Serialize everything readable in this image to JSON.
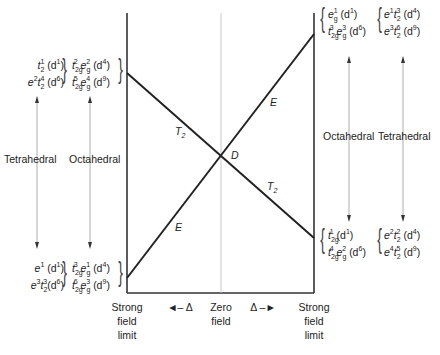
{
  "diagram": {
    "type": "correlation-diagram",
    "line_labels": {
      "t2_upper": "T",
      "t2_upper_sub": "2",
      "t2_lower": "T",
      "t2_lower_sub": "2",
      "e_upper": "E",
      "e_lower": "E",
      "center": "D"
    },
    "left_upper": {
      "tetrahedral": [
        {
          "t": "t",
          "sub": "2",
          "sup": "1",
          "d": "(d",
          "dsup": "1",
          "close": ")"
        },
        {
          "t": "e",
          "sup": "2",
          "t2": "t",
          "sub2": "2",
          "sup2": "4",
          "d": "(d",
          "dsup": "6",
          "close": ")"
        }
      ],
      "octahedral": [
        {
          "a": "t",
          "asub": "2g",
          "asup": "2",
          "b": "e",
          "bsub": "g",
          "bsup": "2",
          "d": "(d",
          "dsup": "4",
          "close": ")"
        },
        {
          "a": "t",
          "asub": "2g",
          "asup": "5",
          "b": "e",
          "bsub": "g",
          "bsup": "4",
          "d": "(d",
          "dsup": "9",
          "close": ")"
        }
      ]
    },
    "left_lower": {
      "tetrahedral": [
        {
          "text": "e",
          "sup": "1",
          "d": "(d",
          "dsup": "1",
          "close": ")"
        },
        {
          "text": "e",
          "sup": "3",
          "t2": "t",
          "sub2": "2",
          "sup2": "3",
          "d": "(d",
          "dsup": "6",
          "close": ")"
        }
      ],
      "octahedral": [
        {
          "a": "t",
          "asub": "2g",
          "asup": "3",
          "b": "e",
          "bsub": "g",
          "bsup": "1",
          "d": "(d",
          "dsup": "4",
          "close": ")"
        },
        {
          "a": "t",
          "asub": "2g",
          "asup": "6",
          "b": "e",
          "bsub": "g",
          "bsup": "3",
          "d": "(d",
          "dsup": "9",
          "close": ")"
        }
      ]
    },
    "right_upper": {
      "octahedral": [
        {
          "a": "e",
          "asub": "g",
          "asup": "1",
          "d": "(d",
          "dsup": "1",
          "close": ")"
        },
        {
          "a": "t",
          "asub": "2g",
          "asup": "3",
          "b": "e",
          "bsub": "g",
          "bsup": "3",
          "d": "(d",
          "dsup": "6",
          "close": ")"
        }
      ],
      "tetrahedral": [
        {
          "a": "e",
          "asup": "1",
          "b": "t",
          "bsub": "2",
          "bsup": "3",
          "d": "(d",
          "dsup": "4",
          "close": ")"
        },
        {
          "a": "e",
          "asup": "3",
          "b": "t",
          "bsub": "2",
          "bsup": "6",
          "d": "(d",
          "dsup": "9",
          "close": ")"
        }
      ]
    },
    "right_lower": {
      "octahedral": [
        {
          "a": "t",
          "asub": "2g",
          "asup": "1",
          "d": "(d",
          "dsup": "1",
          "close": ")"
        },
        {
          "a": "t",
          "asub": "2g",
          "asup": "4",
          "b": "e",
          "bsub": "g",
          "bsup": "2",
          "d": "(d",
          "dsup": "6",
          "close": ")"
        }
      ],
      "tetrahedral": [
        {
          "a": "e",
          "asup": "2",
          "b": "t",
          "bsub": "2",
          "bsup": "2",
          "d": "(d",
          "dsup": "4",
          "close": ")"
        },
        {
          "a": "e",
          "asup": "4",
          "b": "t",
          "bsub": "2",
          "bsup": "5",
          "d": "(d",
          "dsup": "9",
          "close": ")"
        }
      ]
    },
    "left_arrow_labels": {
      "tetrahedral": "Tetrahedral",
      "octahedral": "Octahedral"
    },
    "right_arrow_labels": {
      "octahedral": "Octahedral",
      "tetrahedral": "Tetrahedral"
    },
    "axis": {
      "left": [
        "Strong",
        "field",
        "limit"
      ],
      "left_delta": "◄– Δ",
      "center": [
        "Zero",
        "field"
      ],
      "right_delta": "Δ –►",
      "right": [
        "Strong",
        "field",
        "limit"
      ]
    }
  }
}
